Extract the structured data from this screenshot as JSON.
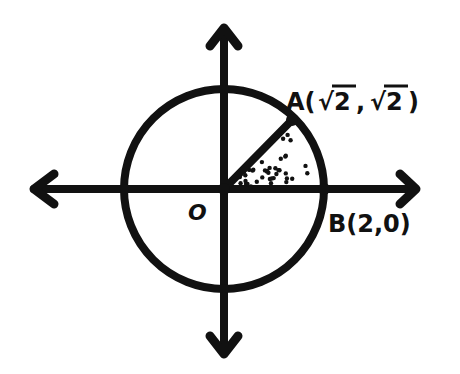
{
  "diagram": {
    "type": "unit-circle-sector",
    "ink_color": "#111111",
    "background": "#ffffff",
    "circle": {
      "center_label": "O",
      "radius_value": 2
    },
    "points": {
      "origin": {
        "label": "O"
      },
      "A": {
        "name": "A",
        "open": "A(",
        "x": "√2",
        "sep": ",",
        "y": "√2",
        "close": " )"
      },
      "B": {
        "label": "B(2,0)"
      }
    },
    "shaded_sector": {
      "from_angle_deg": 0,
      "to_angle_deg": 45,
      "fill": "stippled"
    }
  }
}
